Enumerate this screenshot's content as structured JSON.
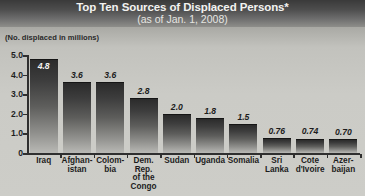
{
  "header": {
    "title": "Top Ten Sources of Displaced Persons*",
    "subtitle": "(as of Jan. 1, 2008)"
  },
  "units_note": "(No. displaced in millions)",
  "chart_data": {
    "type": "bar",
    "title": "Top Ten Sources of Displaced Persons*",
    "subtitle": "(as of Jan. 1, 2008)",
    "xlabel": "",
    "ylabel": "(No. displaced in millions)",
    "ylim": [
      0,
      5.0
    ],
    "grid": false,
    "legend": false,
    "ytick_labels": [
      "5.0",
      "4.0",
      "3.0",
      "2.0",
      "1.0",
      "0"
    ],
    "ytick_values": [
      5.0,
      4.0,
      3.0,
      2.0,
      1.0,
      0
    ],
    "categories": [
      "Iraq",
      "Afghan-\nistan",
      "Colom-\nbia",
      "Dem.\nRep.\nof the\nCongo",
      "Sudan",
      "Uganda",
      "Somalia",
      "Sri\nLanka",
      "Cote\nd'Ivoire",
      "Azer-\nbaijan"
    ],
    "values": [
      4.8,
      3.6,
      3.6,
      2.8,
      2.0,
      1.8,
      1.5,
      0.76,
      0.74,
      0.7
    ],
    "value_labels": [
      "4.8",
      "3.6",
      "3.6",
      "2.8",
      "2.0",
      "1.8",
      "1.5",
      "0.76",
      "0.74",
      "0.70"
    ],
    "label_inside_bar": [
      true,
      false,
      false,
      false,
      false,
      false,
      false,
      false,
      false,
      false
    ]
  },
  "colors": {
    "header_background_top": "#3a3a3a",
    "header_background_bottom": "#8e8e8a",
    "body_background": "#cdcdc8",
    "bar_top": "#2b2b2b",
    "bar_bottom": "#b9b9b5",
    "axis": "#2f2f2f",
    "text": "#1c1c1c",
    "title_text": "#f2f2f0"
  }
}
